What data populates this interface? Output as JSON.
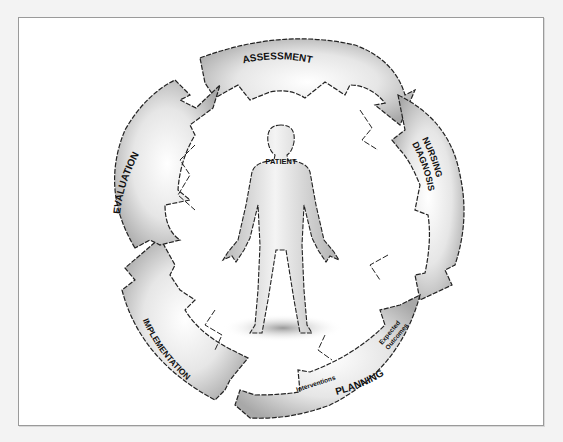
{
  "diagram": {
    "center": {
      "label": "PATIENT"
    },
    "phases": [
      {
        "id": "assessment",
        "label": "ASSESSMENT"
      },
      {
        "id": "nursing-diagnosis",
        "label_line1": "NURSING",
        "label_line2": "DIAGNOSIS"
      },
      {
        "id": "planning",
        "label": "PLANNING",
        "sub_labels": [
          "Expected",
          "Outcomes",
          "Interventions"
        ]
      },
      {
        "id": "implementation",
        "label": "IMPLEMENTATION"
      },
      {
        "id": "evaluation",
        "label": "EVALUATION"
      }
    ],
    "colors": {
      "arrow_fill_light": "#ffffff",
      "arrow_fill_dark": "#9c9c9c",
      "outline": "#222222",
      "frame_border": "#9a9a9a",
      "page_bg": "#f3f3f3"
    }
  }
}
